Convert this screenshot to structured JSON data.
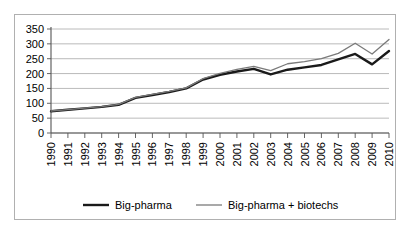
{
  "chart_data": {
    "type": "line",
    "title": "",
    "xlabel": "",
    "ylabel": "",
    "ylim": [
      0,
      350
    ],
    "ytick_step": 50,
    "grid": true,
    "legend_position": "bottom",
    "categories": [
      "1990",
      "1991",
      "1992",
      "1993",
      "1994",
      "1995",
      "1996",
      "1997",
      "1998",
      "1999",
      "2000",
      "2001",
      "2002",
      "2003",
      "2004",
      "2005",
      "2006",
      "2007",
      "2008",
      "2009",
      "2010"
    ],
    "yticks": [
      "0",
      "50",
      "100",
      "150",
      "200",
      "250",
      "300",
      "350"
    ],
    "series": [
      {
        "name": "Big-pharma",
        "color": "#1a1a1a",
        "width": 2.4,
        "values": [
          73,
          78,
          83,
          88,
          95,
          118,
          128,
          138,
          150,
          180,
          196,
          207,
          216,
          197,
          213,
          221,
          229,
          248,
          266,
          231,
          276
        ]
      },
      {
        "name": "Big-pharma + biotechs",
        "color": "#7a7a7a",
        "width": 1.3,
        "values": [
          74,
          79,
          84,
          89,
          96,
          120,
          130,
          140,
          152,
          183,
          201,
          214,
          224,
          210,
          233,
          240,
          250,
          268,
          302,
          266,
          315
        ]
      }
    ]
  },
  "legend": {
    "items": [
      {
        "label": "Big-pharma",
        "color": "#1a1a1a",
        "width": 2.4
      },
      {
        "label": "Big-pharma + biotechs",
        "color": "#7a7a7a",
        "width": 1.3
      }
    ]
  }
}
